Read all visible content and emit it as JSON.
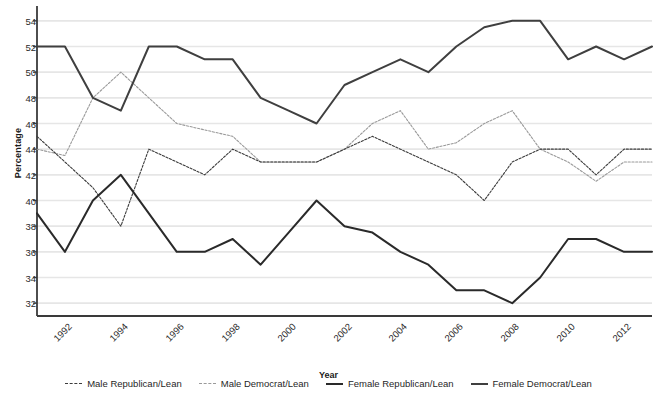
{
  "chart_data": {
    "type": "line",
    "title": "",
    "xlabel": "Year",
    "ylabel": "Percentage",
    "xlim": [
      1992,
      2014
    ],
    "ylim": [
      31,
      55
    ],
    "yticks": [
      32,
      34,
      36,
      38,
      40,
      42,
      44,
      46,
      48,
      50,
      52,
      54
    ],
    "xticks": [
      1992,
      1994,
      1996,
      1998,
      2000,
      2002,
      2004,
      2006,
      2008,
      2010,
      2012,
      2014
    ],
    "x": [
      1992,
      1993,
      1994,
      1995,
      1996,
      1997,
      1998,
      1999,
      2000,
      2001,
      2002,
      2003,
      2004,
      2005,
      2006,
      2007,
      2008,
      2009,
      2010,
      2011,
      2012,
      2013,
      2014
    ],
    "grid": "horizontal",
    "legend_position": "bottom",
    "series": [
      {
        "name": "Male Republican/Lean",
        "style": "dashed",
        "color": "#3c3c3c",
        "width": 1.1,
        "values": [
          45,
          43,
          41,
          38,
          44,
          43,
          42,
          44,
          43,
          43,
          43,
          44,
          45,
          44,
          43,
          42,
          40,
          43,
          44,
          44,
          42,
          44,
          44
        ]
      },
      {
        "name": "Male Democrat/Lean",
        "style": "dashed",
        "color": "#9a9a9a",
        "width": 1.1,
        "values": [
          44,
          43.5,
          48,
          50,
          48,
          46,
          45.5,
          45,
          43,
          43,
          43,
          44,
          46,
          47,
          44,
          44.5,
          46,
          47,
          44,
          43,
          41.5,
          43,
          43
        ]
      },
      {
        "name": "Female Republican/Lean",
        "style": "solid",
        "color": "#2a2a2a",
        "width": 2.0,
        "values": [
          39,
          36,
          40,
          42,
          39,
          36,
          36,
          37,
          35,
          37.5,
          40,
          38,
          37.5,
          36,
          35,
          33,
          33,
          32,
          34,
          37,
          37,
          36,
          36
        ]
      },
      {
        "name": "Female Democrat/Lean",
        "style": "solid",
        "color": "#3f3f3f",
        "width": 2.0,
        "values": [
          52,
          52,
          48,
          47,
          52,
          52,
          51,
          51,
          48,
          47,
          46,
          49,
          50,
          51,
          50,
          52,
          53.5,
          54,
          54,
          51,
          52,
          51,
          52
        ]
      }
    ]
  },
  "axis": {
    "y_title": "Percentage",
    "x_title": "Year"
  },
  "legend": {
    "items": [
      {
        "label": "Male Republican/Lean"
      },
      {
        "label": "Male Democrat/Lean"
      },
      {
        "label": "Female Republican/Lean"
      },
      {
        "label": "Female Democrat/Lean"
      }
    ]
  }
}
